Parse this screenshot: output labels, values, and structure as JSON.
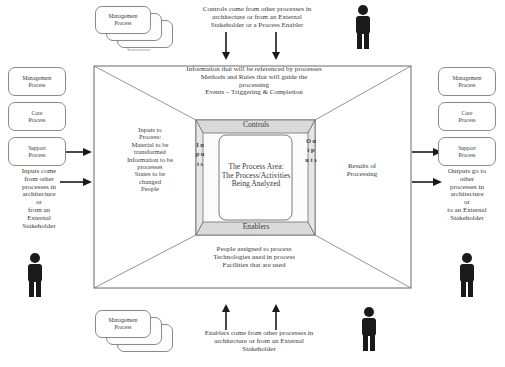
{
  "diagram": {
    "center": {
      "label": "The Process Area:\nThe Process/Activities\nBeing Analyzed"
    },
    "bands": {
      "controls": "Controls",
      "enablers": "Enablers",
      "inputs_vertical": "I\nn\np\nu\nt\ns",
      "outputs_vertical": "O\nu\nt\np\nu\nt\ns"
    },
    "top": {
      "callout": "Controls come from other processes in\narchitecture or from an External\nStakeholder or a Process Enabler",
      "detail": "Information that will be referenced by processes\nMethods and Rules that will guide the\nprocessing\nEvents – Triggering & Completion"
    },
    "bottom": {
      "detail": "People assigned to process\nTechnologies used in process\nFacilities that are used",
      "callout": "Enablers come from other processes in\narchitecture or from an External\nStakeholder"
    },
    "left": {
      "detail": "Inputs to\nProcess:\nMaterial to be\ntransformed\nInformation to be\nprocesses\nStates to be\nchanged\nPeople",
      "source": "Inputs come\nfrom other\nprocesses in\narchitecture\nor\nfrom an\nExternal\nStakeholder",
      "boxes": [
        {
          "label": "Management\nProcess"
        },
        {
          "label": "Core\nProcess"
        },
        {
          "label": "Support\nProcess"
        }
      ]
    },
    "right": {
      "detail": "Results of\nProcessing",
      "destination": "Outputs go to\nother\nprocesses in\narchitecture\nor\nto an External\nStakeholder",
      "boxes": [
        {
          "label": "Management\nProcess"
        },
        {
          "label": "Core\nProcess"
        },
        {
          "label": "Support\nProcess"
        }
      ]
    },
    "stacks": {
      "top": {
        "front": "Management\nProcess",
        "middle": "Core\nProcess",
        "back": "Support\nProcess"
      },
      "bottom": {
        "front": "Management\nProcess",
        "middle": "Core\nProcess",
        "back": "Support\nProcess"
      }
    },
    "icons": {
      "person": "person-icon",
      "arrow": "arrow-icon"
    },
    "colors": {
      "band_fill": "#d9d9d9",
      "panel_fill": "#f2f2f2",
      "stroke": "#555555",
      "text": "#3a3a3a",
      "person": "#1a1a1a"
    }
  }
}
